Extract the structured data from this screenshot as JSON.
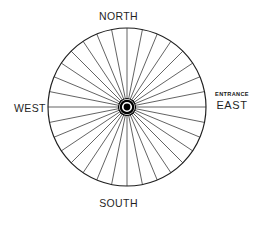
{
  "diagram": {
    "kind": "wheel-plan-view",
    "background_color": "#ffffff",
    "stroke_color": "#1f1f1f",
    "hub_color": "#000000",
    "circle": {
      "center_x": 127,
      "center_y": 107,
      "radius": 79,
      "rim_stroke_width": 1.15
    },
    "spokes": {
      "count": 32,
      "stroke_width": 0.7,
      "start_angle_deg": 0,
      "inner_radius": 7
    },
    "hub": {
      "outer_ring_radius": 8.5,
      "outer_ring_stroke_width": 1.2,
      "mid_ring_radius": 6.2,
      "dot_radius": 3.4
    }
  },
  "labels": {
    "north": "NORTH",
    "south": "SOUTH",
    "west": "WEST",
    "east": "EAST",
    "entrance": "ENTRANCE"
  }
}
